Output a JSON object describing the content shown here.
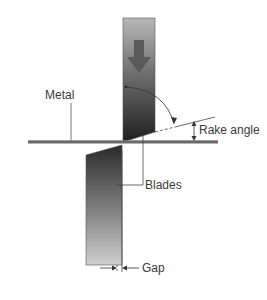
{
  "diagram": {
    "labels": {
      "metal": "Metal",
      "rake_angle": "Rake angle",
      "blades": "Blades",
      "gap": "Gap"
    },
    "icons": {
      "force_arrow": "down-arrow"
    },
    "colors": {
      "blade_dark": "#2a2a2a",
      "blade_light": "#c8c8c8",
      "metal": "#6a6a6a",
      "line": "#3a3a3a",
      "text": "#3a3a3a"
    }
  }
}
